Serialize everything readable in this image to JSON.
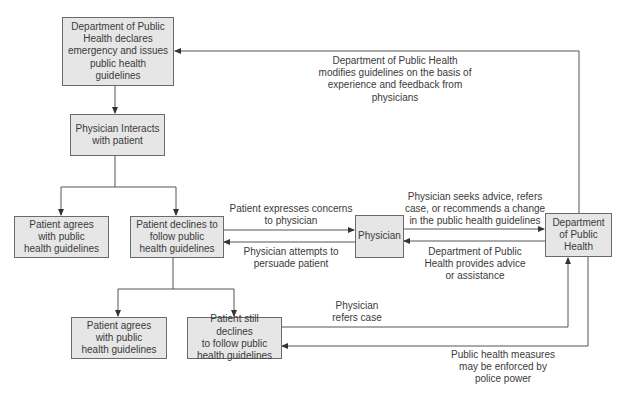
{
  "diagram": {
    "type": "flowchart",
    "nodes": {
      "declare": "Department of Public Health declares emergency and issues public health guidelines",
      "interact": "Physician Interacts with patient",
      "agrees1": "Patient agrees with public health guidelines",
      "declines": "Patient declines to follow public health guidelines",
      "physician": "Physician",
      "dept": "Department of Public Health",
      "agrees2": "Patient agrees with public health guidelines",
      "still_declines": "Patient still declines to follow public health guidelines"
    },
    "node_lines": {
      "declare": [
        "Department of Public",
        "Health declares",
        "emergency and issues",
        "public health",
        "guidelines"
      ],
      "interact": [
        "Physician Interacts",
        "with patient"
      ],
      "agrees1": [
        "Patient agrees",
        "with public",
        "health guidelines"
      ],
      "declines": [
        "Patient declines to",
        "follow public",
        "health guidelines"
      ],
      "physician": [
        "Physician"
      ],
      "dept": [
        "Department",
        "of Public",
        "Health"
      ],
      "agrees2": [
        "Patient agrees",
        "with public",
        "health guidelines"
      ],
      "still_declines": [
        "Patient still declines",
        "to follow public",
        "health guidelines"
      ]
    },
    "edge_labels": {
      "modifies": [
        "Department of Public Health",
        "modifies guidelines on the basis of",
        "experience and feedback from",
        "physicians"
      ],
      "expresses": [
        "Patient expresses concerns",
        "to physician"
      ],
      "persuade": [
        "Physician attempts to",
        "persuade patient"
      ],
      "seeks": [
        "Physician seeks advice, refers",
        "case, or recommends a change",
        "in the public health guidelines"
      ],
      "provides": [
        "Department of Public",
        "Health provides advice",
        "or assistance"
      ],
      "refers": [
        "Physician",
        "refers case"
      ],
      "enforced": [
        "Public health measures",
        "may be enforced by",
        "police power"
      ]
    },
    "colors": {
      "box_fill": "#e6e6e6",
      "line": "#555555",
      "text": "#3a3a3a"
    }
  }
}
